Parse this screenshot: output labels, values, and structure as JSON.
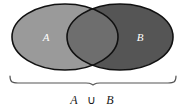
{
  "figure": {
    "type": "venn-diagram",
    "name": "union-of-two-sets",
    "background_color": "#ffffff"
  },
  "sets": [
    {
      "id": "A",
      "label": "A",
      "label_color": "#ffffff",
      "fill_color": "#9a9a9a",
      "stroke_color": "#111111",
      "center_x": 65,
      "center_y": 37,
      "radius_x": 53,
      "radius_y": 33
    },
    {
      "id": "B",
      "label": "B",
      "label_color": "#ffffff",
      "fill_color": "#555555",
      "stroke_color": "#111111",
      "center_x": 120,
      "center_y": 37,
      "radius_x": 53,
      "radius_y": 33
    }
  ],
  "intersection": {
    "fill_color": "#6e6e6e",
    "label": ""
  },
  "brace": {
    "stroke_color": "#555555",
    "left_x": 10,
    "right_x": 176,
    "top_y": 76,
    "tip_x": 93,
    "tip_y": 85
  },
  "caption": {
    "full": "A ∪ B",
    "left_operand": "A",
    "operator": "∪",
    "right_operand": "B",
    "color": "#1a1a1a",
    "x": 93,
    "y": 104
  }
}
